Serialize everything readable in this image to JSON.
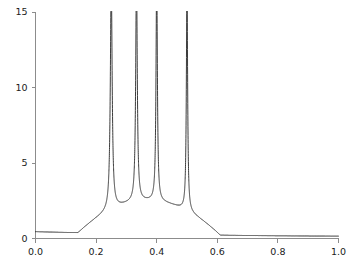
{
  "chart_data": {
    "type": "line",
    "title": "",
    "subtitle": "",
    "xlabel": "",
    "ylabel": "",
    "xlim": [
      0.0,
      1.0
    ],
    "ylim": [
      0.0,
      15.0
    ],
    "grid": false,
    "legend": null,
    "xticks": [
      0.0,
      0.2,
      0.4,
      0.6,
      0.8,
      1.0
    ],
    "xtick_labels": [
      "0.0",
      "0.2",
      "0.4",
      "0.6",
      "0.8",
      "1.0"
    ],
    "yticks": [
      0,
      5,
      10,
      15
    ],
    "ytick_labels": [
      "0",
      "5",
      "10",
      "15"
    ],
    "series": [
      {
        "name": "resonance",
        "color": "#262626",
        "description": "Sum of four sharp Lorentzian resonance peaks on a slowly decaying background; all peaks clipped at the top of the axis (y = 15).",
        "peaks": [
          {
            "x": 0.25,
            "height": 15,
            "half_width": 0.0035,
            "clipped": true
          },
          {
            "x": 0.3333,
            "height": 15,
            "half_width": 0.003,
            "clipped": true
          },
          {
            "x": 0.4,
            "height": 15,
            "half_width": 0.0026,
            "clipped": true
          },
          {
            "x": 0.5,
            "height": 15,
            "half_width": 0.0024,
            "clipped": true
          }
        ],
        "valleys": [
          {
            "x": 0.29,
            "y": 2.7
          },
          {
            "x": 0.368,
            "y": 3.9
          },
          {
            "x": 0.462,
            "y": 2.0
          }
        ],
        "endpoints": [
          {
            "x": 0.0,
            "y": 0.45
          },
          {
            "x": 1.0,
            "y": 0.1
          }
        ],
        "x": [
          0.0,
          0.02,
          0.04,
          0.06,
          0.08,
          0.1,
          0.12,
          0.14,
          0.16,
          0.18,
          0.2,
          0.21,
          0.22,
          0.23,
          0.235,
          0.24,
          0.244,
          0.247,
          0.249,
          0.25,
          0.251,
          0.253,
          0.256,
          0.26,
          0.265,
          0.27,
          0.28,
          0.29,
          0.3,
          0.31,
          0.32,
          0.325,
          0.33,
          0.3315,
          0.3325,
          0.3333,
          0.3341,
          0.3351,
          0.3365,
          0.338,
          0.342,
          0.348,
          0.355,
          0.362,
          0.368,
          0.375,
          0.382,
          0.39,
          0.395,
          0.3975,
          0.399,
          0.4,
          0.401,
          0.4025,
          0.405,
          0.41,
          0.418,
          0.428,
          0.44,
          0.452,
          0.462,
          0.472,
          0.482,
          0.49,
          0.495,
          0.4978,
          0.499,
          0.5,
          0.501,
          0.5022,
          0.505,
          0.51,
          0.518,
          0.53,
          0.545,
          0.56,
          0.58,
          0.6,
          0.63,
          0.66,
          0.7,
          0.75,
          0.8,
          0.85,
          0.9,
          0.95,
          1.0
        ],
        "y": [
          0.45,
          0.46,
          0.5,
          0.56,
          0.64,
          0.75,
          0.9,
          1.1,
          1.38,
          1.78,
          2.4,
          2.85,
          3.5,
          4.7,
          5.8,
          7.6,
          10.2,
          13.0,
          14.8,
          15.0,
          14.8,
          12.6,
          9.4,
          6.6,
          4.6,
          3.7,
          2.95,
          2.7,
          2.85,
          3.35,
          4.6,
          6.0,
          9.8,
          12.2,
          14.0,
          15.0,
          14.0,
          12.0,
          9.0,
          7.0,
          5.0,
          4.2,
          3.95,
          3.9,
          3.92,
          4.2,
          4.9,
          6.6,
          9.2,
          11.6,
          13.8,
          15.0,
          13.8,
          11.2,
          8.4,
          6.0,
          4.4,
          3.4,
          2.75,
          2.25,
          2.0,
          2.05,
          2.3,
          2.9,
          3.9,
          5.6,
          9.0,
          15.0,
          9.4,
          6.2,
          4.0,
          2.7,
          1.9,
          1.35,
          1.0,
          0.8,
          0.6,
          0.48,
          0.36,
          0.29,
          0.23,
          0.18,
          0.15,
          0.13,
          0.12,
          0.11,
          0.1
        ]
      }
    ],
    "annotations": []
  },
  "axes": {
    "x_axis_name": "x-axis",
    "y_axis_name": "y-axis",
    "axis_color": "#8c8c8c",
    "curve_color": "#262626",
    "background_color": "#ffffff"
  }
}
